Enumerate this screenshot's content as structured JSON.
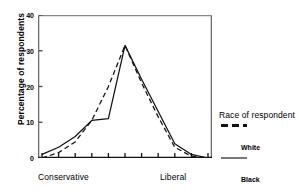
{
  "chart_data": {
    "type": "line",
    "title": "",
    "xlabel": "",
    "ylabel": "Percentage of respondents",
    "ylim": [
      0,
      40
    ],
    "yticks": [
      0,
      10,
      20,
      30,
      40
    ],
    "grid": false,
    "x": [
      1,
      2,
      3,
      4,
      5,
      6,
      7,
      8,
      9,
      10,
      11
    ],
    "x_axis_endpoint_labels": {
      "left": "Conservative",
      "right": "Liberal"
    },
    "xtick_count": 11,
    "legend_position": "right",
    "legend_title": "Race of respondent",
    "series": [
      {
        "name": "White",
        "style": "dashed",
        "color": "#111111",
        "values": [
          0,
          1.5,
          4.5,
          10.5,
          20,
          31.5,
          21,
          11.5,
          3,
          0.5,
          0
        ]
      },
      {
        "name": "Black",
        "style": "solid",
        "color": "#111111",
        "values": [
          1,
          3,
          6,
          10.5,
          11,
          31.5,
          22,
          13,
          4,
          1,
          0
        ]
      }
    ]
  },
  "axis": {
    "ytick_labels": [
      "40",
      "30",
      "20",
      "10",
      "0"
    ],
    "ylabel": "Percentage of respondents",
    "left_label": "Conservative",
    "right_label": "Liberal"
  },
  "legend": {
    "title": "Race of respondent",
    "items": [
      {
        "label": "White",
        "style": "dashed"
      },
      {
        "label": "Black",
        "style": "solid"
      }
    ]
  }
}
